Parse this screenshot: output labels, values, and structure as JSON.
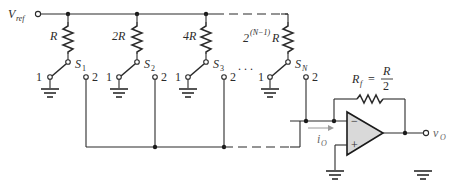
{
  "labels": {
    "vref": "V",
    "vref_sub": "ref",
    "rf_lhs": "R",
    "rf_sub": "f",
    "rf_eq": "=",
    "rf_num": "R",
    "rf_den": "2",
    "io": "i",
    "io_sub": "O",
    "vo": "v",
    "vo_sub": "O",
    "ellipsis": ". . .",
    "opamp_minus": "−",
    "opamp_plus": "+"
  },
  "branches": [
    {
      "resistor": "R",
      "switch": "S",
      "switch_sub": "1",
      "pos1": "1",
      "pos2": "2"
    },
    {
      "resistor": "2R",
      "switch": "S",
      "switch_sub": "2",
      "pos1": "1",
      "pos2": "2"
    },
    {
      "resistor": "4R",
      "switch": "S",
      "switch_sub": "3",
      "pos1": "1",
      "pos2": "2"
    },
    {
      "resistor_base": "2",
      "resistor_exp": "(N−1)",
      "resistor_suffix": "R",
      "switch": "S",
      "switch_sub": "N",
      "pos1": "1",
      "pos2": "2"
    }
  ],
  "icons": {
    "ground": "ground-icon",
    "resistor": "resistor-icon",
    "switch": "spdt-switch-icon",
    "opamp": "op-amp-icon"
  }
}
